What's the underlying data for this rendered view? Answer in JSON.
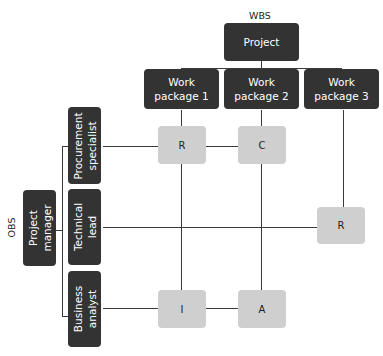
{
  "wbs": {
    "label": "WBS",
    "root": "Project",
    "packages": [
      "Work\npackage 1",
      "Work\npackage 2",
      "Work\npackage 3"
    ]
  },
  "obs": {
    "label": "OBS",
    "root": "Project\nmanager",
    "roles": [
      "Procurement\nspecialist",
      "Technical\nlead",
      "Business\nanalyst"
    ]
  },
  "matrix": {
    "procurement_wp1": "R",
    "procurement_wp2": "C",
    "technical_wp3": "R",
    "analyst_wp1": "I",
    "analyst_wp2": "A"
  },
  "colors": {
    "dark_box": "#333333",
    "cell_box": "#cfcfcf",
    "line": "#3a3a3a"
  }
}
